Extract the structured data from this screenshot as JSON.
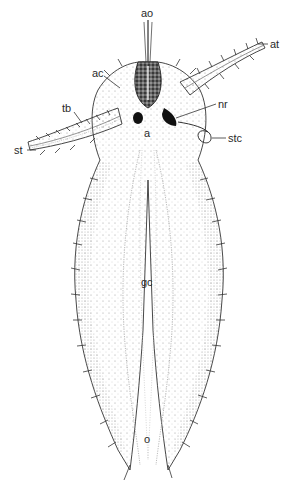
{
  "figure": {
    "type": "anatomical line drawing",
    "colors": {
      "ink": "#2a2a2a",
      "stipple": "#9a9a9a",
      "background": "#ffffff",
      "organ_fill": "#111111"
    },
    "labels": [
      {
        "id": "ao",
        "text": "ao",
        "x": 145,
        "y": 8
      },
      {
        "id": "at",
        "text": "at",
        "x": 270,
        "y": 40
      },
      {
        "id": "ac",
        "text": "ac",
        "x": 94,
        "y": 70
      },
      {
        "id": "nr",
        "text": "nr",
        "x": 218,
        "y": 100
      },
      {
        "id": "tb",
        "text": "tb",
        "x": 62,
        "y": 105
      },
      {
        "id": "a",
        "text": "a",
        "x": 144,
        "y": 127
      },
      {
        "id": "stc",
        "text": "stc",
        "x": 228,
        "y": 134
      },
      {
        "id": "st",
        "text": "st",
        "x": 17,
        "y": 146
      },
      {
        "id": "gc",
        "text": "gc",
        "x": 143,
        "y": 276
      },
      {
        "id": "o",
        "text": "o",
        "x": 141,
        "y": 434
      }
    ]
  }
}
